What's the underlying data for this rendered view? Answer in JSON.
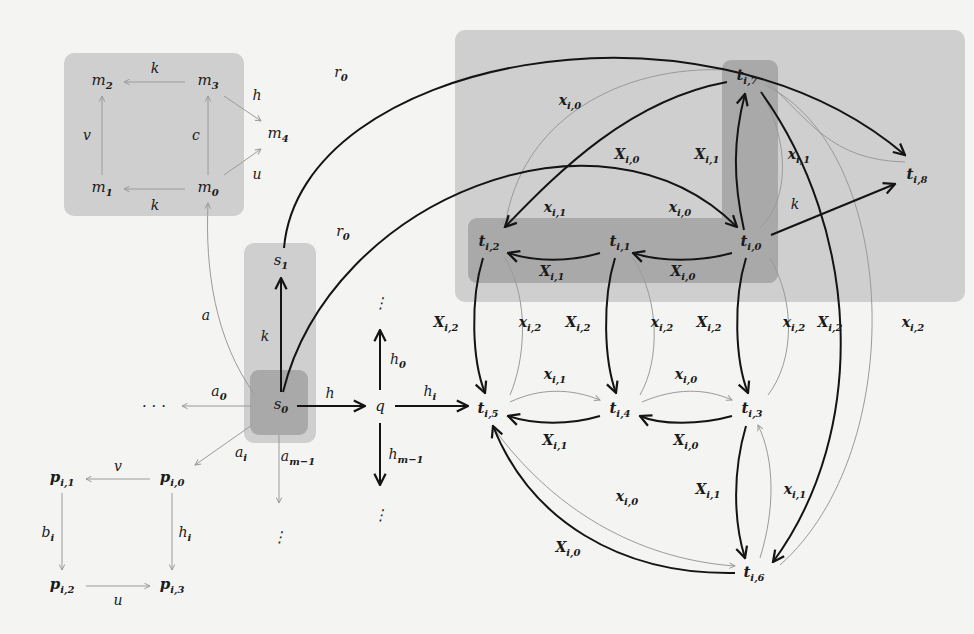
{
  "colors": {
    "background": "#f4f4f2",
    "region_light": "#cfcfcf",
    "region_dark": "#a9a9a9",
    "region_mid": "#bdbdbd",
    "edge_dark": "#141414",
    "edge_light": "#9a9a9a"
  },
  "regions": [
    {
      "id": "m-square",
      "x": 64,
      "y": 53,
      "w": 180,
      "h": 163,
      "tone": "light"
    },
    {
      "id": "s-column",
      "x": 244,
      "y": 243,
      "w": 72,
      "h": 200,
      "tone": "light"
    },
    {
      "id": "s0-box",
      "x": 250,
      "y": 370,
      "w": 58,
      "h": 65,
      "tone": "dark"
    },
    {
      "id": "t-big",
      "x": 455,
      "y": 30,
      "w": 510,
      "h": 272,
      "tone": "light"
    },
    {
      "id": "t-row",
      "x": 468,
      "y": 218,
      "w": 310,
      "h": 65,
      "tone": "dark"
    },
    {
      "id": "t-col",
      "x": 722,
      "y": 60,
      "w": 56,
      "h": 223,
      "tone": "dark"
    }
  ],
  "nodes": [
    {
      "id": "m2",
      "base": "m",
      "sub": "2",
      "x": 102,
      "y": 82
    },
    {
      "id": "m3",
      "base": "m",
      "sub": "3",
      "x": 208,
      "y": 82
    },
    {
      "id": "m4",
      "base": "m",
      "sub": "4",
      "x": 278,
      "y": 135
    },
    {
      "id": "m1",
      "base": "m",
      "sub": "1",
      "x": 102,
      "y": 189
    },
    {
      "id": "m0",
      "base": "m",
      "sub": "0",
      "x": 208,
      "y": 189
    },
    {
      "id": "s1",
      "base": "s",
      "sub": "1",
      "x": 281,
      "y": 262
    },
    {
      "id": "s0",
      "base": "s",
      "sub": "0",
      "x": 281,
      "y": 406
    },
    {
      "id": "q",
      "base": "q",
      "sub": "",
      "x": 380,
      "y": 406
    },
    {
      "id": "dots-left",
      "base": "· · ·",
      "sub": "",
      "x": 154,
      "y": 406
    },
    {
      "id": "dots-q-top",
      "base": "⋮",
      "sub": "",
      "x": 380,
      "y": 303
    },
    {
      "id": "dots-q-bottom",
      "base": "⋮",
      "sub": "",
      "x": 380,
      "y": 515
    },
    {
      "id": "dots-s0-bottom",
      "base": "⋮",
      "sub": "",
      "x": 279,
      "y": 537
    },
    {
      "id": "pi1",
      "base": "p",
      "sub": "i,1",
      "x": 62,
      "y": 479
    },
    {
      "id": "pi0",
      "base": "p",
      "sub": "i,0",
      "x": 172,
      "y": 479
    },
    {
      "id": "pi2",
      "base": "p",
      "sub": "i,2",
      "x": 62,
      "y": 586
    },
    {
      "id": "pi3",
      "base": "p",
      "sub": "i,3",
      "x": 172,
      "y": 586
    },
    {
      "id": "ti7",
      "base": "t",
      "sub": "i,7",
      "x": 747,
      "y": 77
    },
    {
      "id": "ti8",
      "base": "t",
      "sub": "i,8",
      "x": 917,
      "y": 176
    },
    {
      "id": "ti2",
      "base": "t",
      "sub": "i,2",
      "x": 489,
      "y": 243
    },
    {
      "id": "ti1",
      "base": "t",
      "sub": "i,1",
      "x": 620,
      "y": 243
    },
    {
      "id": "ti0",
      "base": "t",
      "sub": "i,0",
      "x": 751,
      "y": 243
    },
    {
      "id": "ti5",
      "base": "t",
      "sub": "i,5",
      "x": 488,
      "y": 410
    },
    {
      "id": "ti4",
      "base": "t",
      "sub": "i,4",
      "x": 620,
      "y": 410
    },
    {
      "id": "ti3",
      "base": "t",
      "sub": "i,3",
      "x": 752,
      "y": 410
    },
    {
      "id": "ti6",
      "base": "t",
      "sub": "i,6",
      "x": 754,
      "y": 574
    }
  ],
  "edge_labels": [
    {
      "text": "k",
      "sub": "",
      "x": 155,
      "y": 68
    },
    {
      "text": "h",
      "sub": "",
      "x": 257,
      "y": 95
    },
    {
      "text": "v",
      "sub": "",
      "x": 87,
      "y": 135
    },
    {
      "text": "c",
      "sub": "",
      "x": 196,
      "y": 135
    },
    {
      "text": "u",
      "sub": "",
      "x": 257,
      "y": 174
    },
    {
      "text": "k",
      "sub": "",
      "x": 155,
      "y": 205
    },
    {
      "text": "r",
      "sub": "0",
      "x": 341,
      "y": 74
    },
    {
      "text": "r",
      "sub": "0",
      "x": 343,
      "y": 233
    },
    {
      "text": "a",
      "sub": "",
      "x": 206,
      "y": 315
    },
    {
      "text": "k",
      "sub": "",
      "x": 265,
      "y": 336
    },
    {
      "text": "a",
      "sub": "0",
      "x": 219,
      "y": 393
    },
    {
      "text": "h",
      "sub": "",
      "x": 330,
      "y": 393
    },
    {
      "text": "h",
      "sub": "0",
      "x": 398,
      "y": 361
    },
    {
      "text": "h",
      "sub": "i",
      "x": 430,
      "y": 393
    },
    {
      "text": "a",
      "sub": "i",
      "x": 241,
      "y": 454
    },
    {
      "text": "a",
      "sub": "m−1",
      "x": 298,
      "y": 458
    },
    {
      "text": "h",
      "sub": "m−1",
      "x": 406,
      "y": 456
    },
    {
      "text": "v",
      "sub": "",
      "x": 118,
      "y": 466
    },
    {
      "text": "b",
      "sub": "i",
      "x": 48,
      "y": 534
    },
    {
      "text": "h",
      "sub": "i",
      "x": 185,
      "y": 534
    },
    {
      "text": "u",
      "sub": "",
      "x": 118,
      "y": 600
    },
    {
      "text": "x",
      "sub": "i,0",
      "x": 570,
      "y": 102
    },
    {
      "text": "X",
      "sub": "i,0",
      "x": 627,
      "y": 156
    },
    {
      "text": "X",
      "sub": "i,1",
      "x": 707,
      "y": 156
    },
    {
      "text": "x",
      "sub": "i,1",
      "x": 555,
      "y": 209
    },
    {
      "text": "x",
      "sub": "i,0",
      "x": 680,
      "y": 209
    },
    {
      "text": "x",
      "sub": "i,1",
      "x": 799,
      "y": 156
    },
    {
      "text": "k",
      "sub": "",
      "x": 795,
      "y": 204
    },
    {
      "text": "X",
      "sub": "i,1",
      "x": 552,
      "y": 273
    },
    {
      "text": "X",
      "sub": "i,0",
      "x": 683,
      "y": 273
    },
    {
      "text": "X",
      "sub": "i,2",
      "x": 446,
      "y": 324
    },
    {
      "text": "x",
      "sub": "i,2",
      "x": 530,
      "y": 324
    },
    {
      "text": "X",
      "sub": "i,2",
      "x": 578,
      "y": 324
    },
    {
      "text": "x",
      "sub": "i,2",
      "x": 662,
      "y": 324
    },
    {
      "text": "X",
      "sub": "i,2",
      "x": 709,
      "y": 324
    },
    {
      "text": "x",
      "sub": "i,2",
      "x": 794,
      "y": 324
    },
    {
      "text": "X",
      "sub": "i,2",
      "x": 830,
      "y": 324
    },
    {
      "text": "x",
      "sub": "i,2",
      "x": 913,
      "y": 324
    },
    {
      "text": "x",
      "sub": "i,1",
      "x": 555,
      "y": 376
    },
    {
      "text": "x",
      "sub": "i,0",
      "x": 686,
      "y": 376
    },
    {
      "text": "X",
      "sub": "i,1",
      "x": 555,
      "y": 442
    },
    {
      "text": "X",
      "sub": "i,0",
      "x": 686,
      "y": 442
    },
    {
      "text": "X",
      "sub": "i,1",
      "x": 708,
      "y": 491
    },
    {
      "text": "x",
      "sub": "i,1",
      "x": 795,
      "y": 491
    },
    {
      "text": "x",
      "sub": "i,0",
      "x": 627,
      "y": 498
    },
    {
      "text": "X",
      "sub": "i,0",
      "x": 568,
      "y": 549
    }
  ]
}
